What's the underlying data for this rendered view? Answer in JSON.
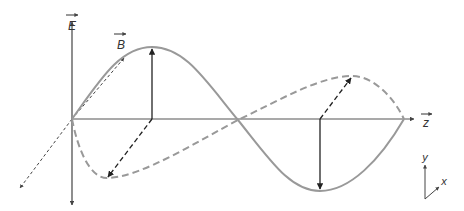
{
  "labels": {
    "electric_field": "E",
    "magnetic_field": "B",
    "propagation_axis": "z",
    "axis_y": "y",
    "axis_x": "x"
  },
  "colors": {
    "axis": "#555555",
    "wave": "#999999",
    "arrow": "#222222",
    "text": "#333333"
  }
}
